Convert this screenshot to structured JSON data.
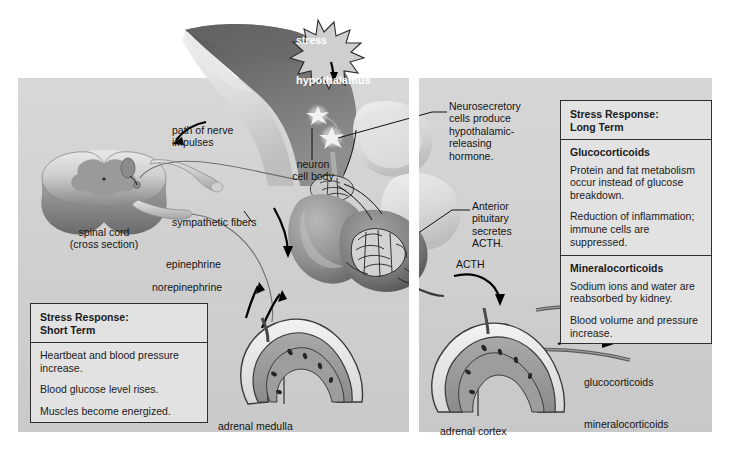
{
  "figure": {
    "colors": {
      "panel_background": "#d2d2d2",
      "page_background": "#ffffff",
      "box_fill": "#e2e2e2",
      "box_border": "#2e2e2e",
      "text": "#141414",
      "white_text": "#ffffff"
    }
  },
  "labels": {
    "stress": "stress",
    "hypothalamus": "hypothalamus",
    "neurosecretory": "Neurosecretory\ncells produce\nhypothalamic-\nreleasing\nhormone.",
    "path_of_nerve": "path of nerve\nimpulses",
    "neuron_cell_body": "neuron\ncell body",
    "spinal_cord": "spinal cord\n(cross section)",
    "sympathetic_fibers": "sympathetic fibers",
    "epinephrine": "epinephrine",
    "norepinephrine": "norepinephrine",
    "anterior_pituitary": "Anterior\npituitary\nsecretes\nACTH.",
    "acth": "ACTH",
    "adrenal_medulla": "adrenal medulla",
    "adrenal_cortex": "adrenal cortex",
    "glucocorticoids_out": "glucocorticoids",
    "mineralocorticoids_out": "mineralocorticoids"
  },
  "short_term_box": {
    "header": "Stress Response:\nShort Term",
    "lines": [
      "Heartbeat and blood pressure increase.",
      "Blood glucose level rises.",
      "Muscles become energized."
    ]
  },
  "long_term_box": {
    "header": "Stress Response:\nLong Term",
    "sections": [
      {
        "subtitle": "Glucocorticoids",
        "lines": [
          "Protein and fat metabolism occur instead of glucose breakdown.",
          "Reduction of inflammation; immune cells are suppressed."
        ]
      },
      {
        "subtitle": "Mineralocorticoids",
        "lines": [
          "Sodium ions and water are reabsorbed by kidney.",
          "Blood volume and pressure increase."
        ]
      }
    ]
  }
}
